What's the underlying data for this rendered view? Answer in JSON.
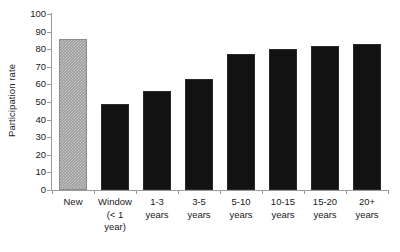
{
  "chart_data": {
    "type": "bar",
    "title": "",
    "xlabel": "",
    "ylabel": "Participation rate",
    "ylim": [
      0,
      100
    ],
    "ytick_step": 10,
    "yticks": [
      100,
      90,
      80,
      70,
      60,
      50,
      40,
      30,
      20,
      10,
      0
    ],
    "grid": false,
    "legend": "none",
    "categories": [
      "New",
      "Window (< 1 year)",
      "1-3 years",
      "3-5 years",
      "5-10 years",
      "10-15 years",
      "15-20 years",
      "20+ years"
    ],
    "category_label_lines": [
      [
        "New"
      ],
      [
        "Window",
        "(< 1",
        "year)"
      ],
      [
        "1-3",
        "years"
      ],
      [
        "3-5",
        "years"
      ],
      [
        "5-10",
        "years"
      ],
      [
        "10-15",
        "years"
      ],
      [
        "15-20",
        "years"
      ],
      [
        "20+",
        "years"
      ]
    ],
    "values": [
      86,
      49,
      56,
      63,
      77,
      80,
      82,
      83
    ],
    "bar_styles": [
      "pattern-gray",
      "pattern-black",
      "pattern-black",
      "pattern-black",
      "pattern-black",
      "pattern-black",
      "pattern-black",
      "pattern-black"
    ],
    "colors": {
      "first_bar_fill": "#9b9b9b",
      "first_bar_pattern": "#c9c9c9",
      "other_bars_fill": "#121212",
      "other_bars_pattern": "#e8e8e8",
      "axis": "#9a9a9a",
      "text": "#1a1a1a",
      "background": "#ffffff"
    }
  }
}
